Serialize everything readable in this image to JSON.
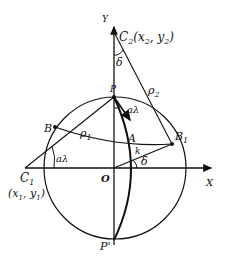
{
  "diagram": {
    "type": "geometry",
    "labels": {
      "y_axis": "Y",
      "x_axis": "X",
      "origin": "O",
      "c2": "C",
      "c2_sub": "2",
      "c2_coords": "(x",
      "c2_coords_x_sub": "2",
      "c2_coords_mid": ", y",
      "c2_coords_y_sub": "2",
      "c2_coords_end": ")",
      "c1": "C",
      "c1_sub": "1",
      "c1_coords": "(x",
      "c1_coords_x_sub": "1",
      "c1_coords_mid": ", y",
      "c1_coords_y_sub": "1",
      "c1_coords_end": ")",
      "p": "P",
      "p_prime": "P'",
      "a": "A",
      "b": "B",
      "b1": "B",
      "b1_sub": "1",
      "rho1": "ρ",
      "rho1_sub": "1",
      "rho2": "ρ",
      "rho2_sub": "2",
      "delta_top": "δ",
      "delta_right": "δ",
      "alpha_lambda_top": "aλ",
      "alpha_lambda_left": "aλ",
      "k": "k"
    },
    "colors": {
      "stroke": "#111111",
      "background": "#ffffff"
    }
  }
}
